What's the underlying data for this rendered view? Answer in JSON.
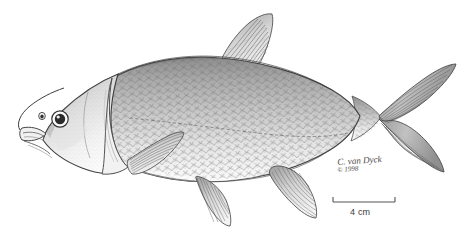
{
  "figure": {
    "orientation": "facing left",
    "medium": "pen and ink stipple / line drawing",
    "background_color": "#ffffff",
    "ink_color": "#3c3c3c"
  },
  "scalebar": {
    "label": "4 cm",
    "length_value": 4,
    "length_unit": "cm",
    "bar_x_start": 333,
    "bar_x_end": 395,
    "bar_y": 202
  },
  "credit": {
    "artist_signature": "C. van Dyck",
    "copyright_line": "© 1998"
  },
  "anatomy": {
    "parts": [
      {
        "name": "head",
        "label": "head"
      },
      {
        "name": "eye",
        "label": "eye"
      },
      {
        "name": "pupil",
        "label": "pupil"
      },
      {
        "name": "nostril",
        "label": "nostril"
      },
      {
        "name": "mouth",
        "label": "mouth"
      },
      {
        "name": "operculum",
        "label": "gill cover"
      },
      {
        "name": "dorsal-fin",
        "label": "dorsal fin"
      },
      {
        "name": "caudal-fin",
        "label": "caudal fin"
      },
      {
        "name": "pectoral-fin",
        "label": "pectoral fin"
      },
      {
        "name": "pelvic-fin",
        "label": "pelvic fin"
      },
      {
        "name": "anal-fin",
        "label": "anal fin"
      },
      {
        "name": "caudal-peduncle",
        "label": "caudal peduncle"
      },
      {
        "name": "lateral-line",
        "label": "lateral line"
      },
      {
        "name": "body-scales",
        "label": "scales"
      }
    ]
  },
  "colors": {
    "ink": "#3c3c3c",
    "ink_light": "#7b7b7b",
    "ink_mid": "#5e5e5e",
    "shade_dark": "#6e6e6e",
    "shade_mid": "#9a9a9a",
    "shade_light": "#c9c9c9",
    "belly": "#fafafa",
    "paper": "#ffffff",
    "scalebar": "#555555"
  }
}
